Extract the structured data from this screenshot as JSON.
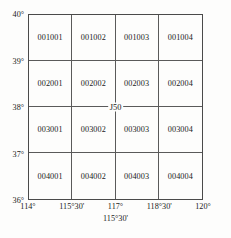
{
  "figure": {
    "center_annotation": "J50",
    "sub_caption": "115°30'"
  },
  "axes": {
    "y_ticks": [
      "40°",
      "39°",
      "38°",
      "37°",
      "36°"
    ],
    "x_ticks": [
      "114°",
      "115°30'",
      "117°",
      "118°30'",
      "120°"
    ]
  },
  "chart_data": {
    "type": "table",
    "title": "J50",
    "xlabel": "115°30'",
    "ylabel": "",
    "grid": true,
    "rows": 4,
    "cols": 4,
    "x_tick_labels": [
      "114°",
      "115°30'",
      "117°",
      "118°30'",
      "120°"
    ],
    "y_tick_labels": [
      "40°",
      "39°",
      "38°",
      "37°",
      "36°"
    ],
    "xlim": [
      114,
      120
    ],
    "ylim": [
      36,
      40
    ],
    "cells": [
      [
        "001001",
        "001002",
        "001003",
        "001004"
      ],
      [
        "002001",
        "002002",
        "002003",
        "002004"
      ],
      [
        "003001",
        "003002",
        "003003",
        "003004"
      ],
      [
        "004001",
        "004002",
        "004003",
        "004004"
      ]
    ],
    "cells_flat": [
      "001001",
      "001002",
      "001003",
      "001004",
      "002001",
      "002002",
      "002003",
      "002004",
      "003001",
      "003002",
      "003003",
      "003004",
      "004001",
      "004002",
      "004003",
      "004004"
    ]
  },
  "colors": {
    "background": "#fdfdfc",
    "grid_line": "#5a5a5a",
    "border": "#4a4a4a",
    "text": "#1b1b1b"
  }
}
